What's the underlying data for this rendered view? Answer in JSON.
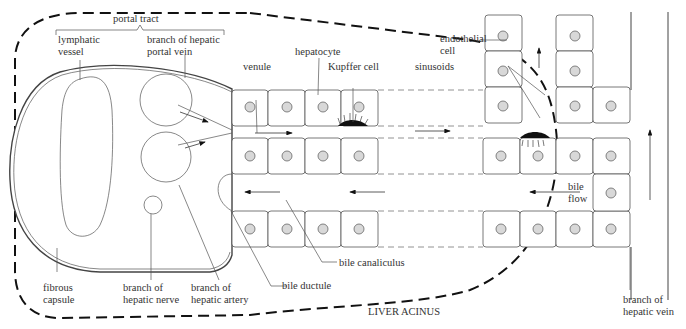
{
  "diagram": {
    "title": "LIVER ACINUS",
    "labels": {
      "portal_tract": "portal tract",
      "lymphatic_vessel_1": "lymphatic",
      "lymphatic_vessel_2": "vessel",
      "portal_vein_1": "branch of hepatic",
      "portal_vein_2": "portal vein",
      "venule": "venule",
      "hepatocyte": "hepatocyte",
      "kupffer_cell": "Kupffer cell",
      "endothelial_cell_1": "endothelial",
      "endothelial_cell_2": "cell",
      "sinusoids": "sinusoids",
      "bile_flow_1": "bile",
      "bile_flow_2": "flow",
      "fibrous_capsule_1": "fibrous",
      "fibrous_capsule_2": "capsule",
      "hepatic_nerve_1": "branch of",
      "hepatic_nerve_2": "hepatic nerve",
      "hepatic_artery_1": "branch of",
      "hepatic_artery_2": "hepatic artery",
      "bile_ductule": "bile ductule",
      "bile_canaliculus": "bile canaliculus",
      "hepatic_vein_1": "branch of",
      "hepatic_vein_2": "hepatic vein",
      "liver_acinus": "LIVER ACINUS"
    }
  }
}
